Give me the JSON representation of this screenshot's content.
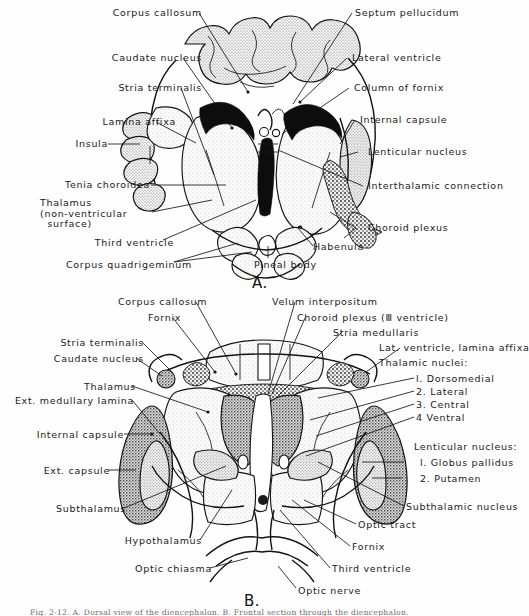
{
  "figure": {
    "title_caption": "Fig. 2-12. A. Dorsal  view  of  the  diencephalon. B. Frontal section through the diencephalon.",
    "panels": [
      {
        "id": "A",
        "letter": "A.",
        "subject": "dorsal view of diencephalon"
      },
      {
        "id": "B",
        "letter": "B.",
        "subject": "frontal section through diencephalon"
      }
    ]
  },
  "panel_a": {
    "letter": "A.",
    "labels_left": [
      {
        "name": "corpus-callosum",
        "text": "Corpus callosum"
      },
      {
        "name": "caudate-nucleus",
        "text": "Caudate nucleus"
      },
      {
        "name": "stria-terminalis",
        "text": "Stria  terminalis"
      },
      {
        "name": "lamina-affixa",
        "text": "Lamina affixa"
      },
      {
        "name": "insula",
        "text": "Insula"
      },
      {
        "name": "tenia-choroidea",
        "text": "Tenia  choroidea"
      },
      {
        "name": "thalamus",
        "text": "Thalamus\n(non-ventricular\n  surface)"
      },
      {
        "name": "third-ventricle",
        "text": "Third ventricle"
      },
      {
        "name": "corpus-quadrigeminum",
        "text": "Corpus  quadrigeminum"
      }
    ],
    "labels_right": [
      {
        "name": "septum-pellucidum",
        "text": "Septum  pellucidum"
      },
      {
        "name": "lateral-ventricle",
        "text": "Lateral  ventricle"
      },
      {
        "name": "column-of-fornix",
        "text": "Column of fornix"
      },
      {
        "name": "internal-capsule",
        "text": "Internal capsule"
      },
      {
        "name": "lenticular-nucleus",
        "text": "Lenticular  nucleus"
      },
      {
        "name": "interthalamic-connection",
        "text": "Interthalamic  connection"
      },
      {
        "name": "choroid-plexus",
        "text": "Choroid  plexus"
      },
      {
        "name": "habenula",
        "text": "Habenula"
      }
    ],
    "labels_bottom": [
      {
        "name": "pineal-body",
        "text": "Pineal body"
      }
    ]
  },
  "panel_b": {
    "letter": "B.",
    "labels_left": [
      {
        "name": "stria-terminalis",
        "text": "Stria  terminalis"
      },
      {
        "name": "caudate-nucleus",
        "text": "Caudate  nucleus"
      },
      {
        "name": "thalamus",
        "text": "Thalamus"
      },
      {
        "name": "ext-medullary-lamina",
        "text": "Ext. medullary lamina"
      },
      {
        "name": "internal-capsule",
        "text": "Internal capsule"
      },
      {
        "name": "ext-capsule",
        "text": "Ext. capsule"
      },
      {
        "name": "subthalamus",
        "text": "Subthalamus"
      },
      {
        "name": "hypothalamus",
        "text": "Hypothalamus"
      },
      {
        "name": "optic-chiasma",
        "text": "Optic chiasma"
      }
    ],
    "labels_top": [
      {
        "name": "corpus-callosum",
        "text": "Corpus callosum"
      },
      {
        "name": "fornix",
        "text": "Fornix"
      },
      {
        "name": "velum-interpositum",
        "text": "Velum  interpositum"
      },
      {
        "name": "choroid-plexus-third-ventricle",
        "text": "Choroid  plexus (Ⅲ ventricle)"
      },
      {
        "name": "stria-medullaris",
        "text": "Stria  medullaris"
      },
      {
        "name": "lat-ventricle-lamina-affixa",
        "text": "Lat. ventricle, lamina affixa"
      }
    ],
    "thalamic_nuclei": {
      "heading": "Thalamic nuclei:",
      "items": [
        "l. Dorsomedial",
        "2. Lateral",
        "3. Central",
        "4 Ventral"
      ]
    },
    "lenticular_nucleus": {
      "heading": "Lenticular  nucleus:",
      "items": [
        "l. Globus pallidus",
        "2. Putamen"
      ]
    },
    "labels_right": [
      {
        "name": "subthalamic-nucleus",
        "text": "Subthalamic  nucleus"
      },
      {
        "name": "optic-tract",
        "text": "Optic  tract"
      },
      {
        "name": "fornix",
        "text": "Fornix"
      },
      {
        "name": "third-ventricle",
        "text": "Third  ventricle"
      },
      {
        "name": "optic-nerve",
        "text": "Optic  nerve"
      }
    ]
  },
  "colors": {
    "ink": "#151515",
    "paper": "#fefefe",
    "stipple_light": "#e9e9e9",
    "stipple_mid": "#c9c9c9",
    "stipple_dark": "#9a9a9a",
    "solid_black": "#0d0d0d"
  }
}
